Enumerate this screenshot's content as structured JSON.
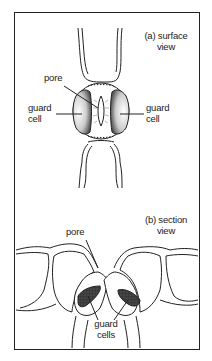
{
  "figure": {
    "panels": [
      {
        "id": "a",
        "title_line1": "(a) surface",
        "title_line2": "view",
        "labels": {
          "pore": "pore",
          "guard_cell_left_line1": "guard",
          "guard_cell_left_line2": "cell",
          "guard_cell_right_line1": "guard",
          "guard_cell_right_line2": "cell"
        }
      },
      {
        "id": "b",
        "title_line1": "(b) section",
        "title_line2": "view",
        "labels": {
          "pore": "pore",
          "guard_cells_line1": "guard",
          "guard_cells_line2": "cells"
        }
      }
    ]
  },
  "colors": {
    "ink": "#222222",
    "fill_dark": "#333333",
    "background": "#ffffff"
  }
}
